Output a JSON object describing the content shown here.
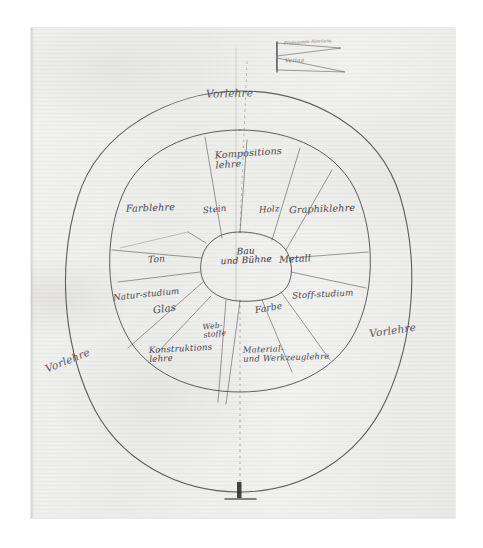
{
  "document": {
    "kind": "handwritten-sketch",
    "subject": "Bauhaus curriculum wheel (Lehrplan-Diagramm)",
    "paper_color": "#efefee",
    "ink_color": "#2b2b2e"
  },
  "flag": {
    "name": "propaganda-flag",
    "line1": "Propaganda Abteilung",
    "line2": "Verlag"
  },
  "rings": {
    "outer": {
      "name": "vorlehre-outer-ring",
      "labels": [
        {
          "text": "Vorlehre",
          "position": "top"
        },
        {
          "text": "Vorlehre",
          "position": "bottom-left"
        },
        {
          "text": "Vorlehre",
          "position": "right"
        }
      ]
    },
    "middle": {
      "name": "werklehre-ring",
      "labels": [
        {
          "text": "Kompositions",
          "text2": "lehre",
          "position": "top"
        },
        {
          "text": "Farblehre",
          "position": "upper-left"
        },
        {
          "text": "Graphiklehre",
          "position": "upper-right"
        },
        {
          "text": "Natur-studium",
          "position": "left"
        },
        {
          "text": "Stoff-studium",
          "position": "right"
        },
        {
          "text": "Konstruktions",
          "text2": "lehre",
          "position": "lower-left"
        },
        {
          "text": "Material-",
          "text2": "und Werkzeuglehre",
          "position": "lower-right"
        }
      ]
    },
    "spokes": {
      "name": "material-spokes",
      "labels": [
        {
          "text": "Stein",
          "position": "top-left-spoke"
        },
        {
          "text": "Holz",
          "position": "top-right-spoke"
        },
        {
          "text": "Ton",
          "position": "left-spoke"
        },
        {
          "text": "Metall",
          "position": "right-spoke"
        },
        {
          "text": "Glas",
          "position": "lower-left-spoke"
        },
        {
          "text": "Farbe",
          "position": "lower-right-spoke"
        },
        {
          "text": "Web-",
          "text2": "stoffe",
          "position": "bottom-spoke"
        }
      ]
    },
    "core": {
      "name": "bau-und-buehne-core",
      "line1": "Bau",
      "line2": "und Bühne"
    }
  },
  "marks": {
    "axis_line_name": "vertical-axis-dotted-line",
    "pedestal_name": "bottom-pedestal-mark"
  }
}
